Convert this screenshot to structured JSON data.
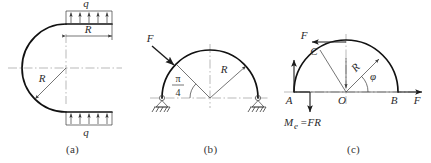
{
  "figure": {
    "panels": [
      {
        "id": "a",
        "caption": "(a)",
        "labels": {
          "load_top": "q",
          "load_bottom": "q",
          "dimension": "R",
          "radius": "R"
        },
        "geometry": {
          "arc_type": "c-shaped-arc",
          "radius_px": 44,
          "center_x": 66,
          "center_y": 68,
          "top_arrow_count": 5,
          "bottom_arrow_count": 5,
          "top_arrow_direction": "up",
          "bottom_arrow_direction": "up"
        }
      },
      {
        "id": "b",
        "caption": "(b)",
        "labels": {
          "force": "F",
          "angle_numerator": "π",
          "angle_denominator": "4",
          "radius": "R"
        },
        "geometry": {
          "arc_type": "semicircle-upper",
          "radius_px": 48,
          "center_x": 72,
          "center_y": 98,
          "force_angle_deg": 135,
          "support_left": "pin-support",
          "support_right": "pin-support"
        }
      },
      {
        "id": "c",
        "caption": "(c)",
        "labels": {
          "force_top": "F",
          "force_right": "F",
          "point_a": "A",
          "point_b": "B",
          "point_c": "C",
          "point_o": "O",
          "angle": "φ",
          "radius": "R",
          "moment": "M",
          "moment_subscript": "e",
          "moment_value": "=FR"
        },
        "geometry": {
          "arc_type": "semicircle-upper",
          "radius_px": 52,
          "center_x": 72,
          "center_y": 98,
          "reaction_a_direction": "up",
          "moment_arrow_direction": "down",
          "force_top_direction": "left",
          "force_right_direction": "right"
        }
      }
    ]
  },
  "colors": {
    "line": "#1c1c1c",
    "centerline": "#8a8a8a",
    "text": "#2b2b2b",
    "background": "#ffffff"
  }
}
